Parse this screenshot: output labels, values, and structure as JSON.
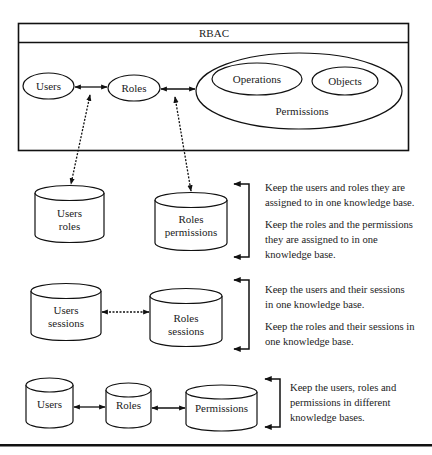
{
  "title": "RBAC",
  "rbac_box": {
    "nodes": {
      "users": "Users",
      "roles": "Roles",
      "permissions": "Permissions",
      "operations": "Operations",
      "objects": "Objects"
    }
  },
  "section1": {
    "db_users_roles": [
      "Users",
      "roles"
    ],
    "db_roles_permissions": [
      "Roles",
      "permissions"
    ],
    "notes": [
      "Keep the users and roles they are assigned to in one knowledge base.",
      "Keep the roles and the permissions they are assigned to in one knowledge base."
    ]
  },
  "section2": {
    "db_users_sessions": [
      "Users",
      "sessions"
    ],
    "db_roles_sessions": [
      "Roles",
      "sessions"
    ],
    "notes": [
      "Keep the users and their sessions in one knowledge base.",
      "Keep the roles and their sessions in one knowledge base."
    ]
  },
  "section3": {
    "db_users": "Users",
    "db_roles": "Roles",
    "db_permissions": "Permissions",
    "notes": [
      "Keep the users, roles and permissions in different knowledge bases."
    ]
  }
}
